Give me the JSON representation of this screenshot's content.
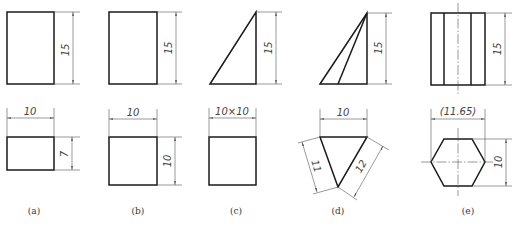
{
  "figure": {
    "panels": [
      {
        "id": "a",
        "label": "(a)",
        "front_view": {
          "shape": "rectangle",
          "height_dim": "15"
        },
        "top_view": {
          "shape": "rectangle",
          "width_dim": "10",
          "depth_dim": "7"
        }
      },
      {
        "id": "b",
        "label": "(b)",
        "front_view": {
          "shape": "rectangle",
          "height_dim": "15"
        },
        "top_view": {
          "shape": "square",
          "width_dim": "10",
          "depth_dim": "10"
        }
      },
      {
        "id": "c",
        "label": "(c)",
        "front_view": {
          "shape": "right-triangle",
          "height_dim": "15"
        },
        "top_view": {
          "shape": "square",
          "width_dim": "10×10"
        }
      },
      {
        "id": "d",
        "label": "(d)",
        "front_view": {
          "shape": "triangular-pyramid",
          "height_dim": "15"
        },
        "top_view": {
          "shape": "triangle",
          "width_dim": "10",
          "left_side_dim": "11",
          "right_side_dim": "12"
        }
      },
      {
        "id": "e",
        "label": "(e)",
        "front_view": {
          "shape": "hexagonal-prism",
          "height_dim": "15"
        },
        "top_view": {
          "shape": "hexagon",
          "width_dim": "(11.65)",
          "depth_dim": "10"
        }
      }
    ]
  }
}
